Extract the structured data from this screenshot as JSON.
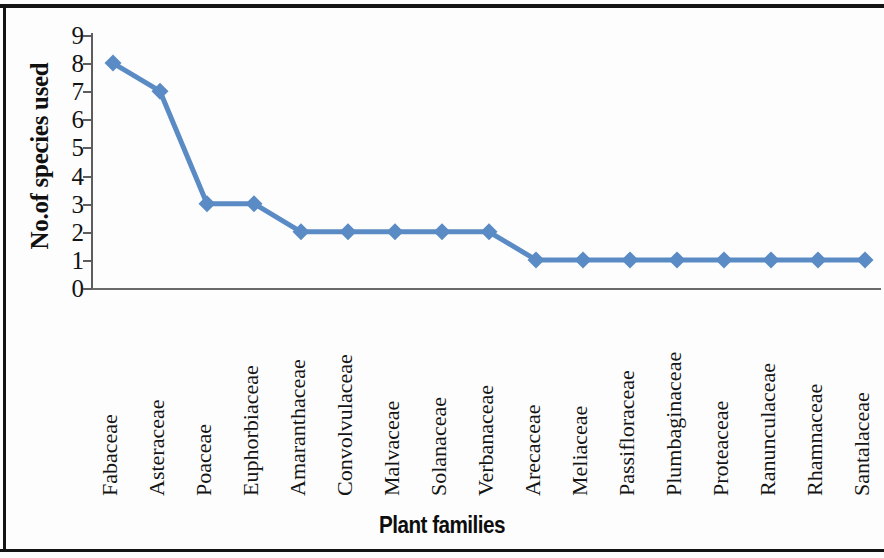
{
  "chart_data": {
    "type": "line",
    "title": "",
    "xlabel": "Plant families",
    "ylabel": "No.of species used",
    "categories": [
      "Fabaceae",
      "Asteraceae",
      "Poaceae",
      "Euphorbiaceae",
      "Amaranthaceae",
      "Convolvulaceae",
      "Malvaceae",
      "Solanaceae",
      "Verbanaceae",
      "Arecaceae",
      "Meliaceae",
      "Passifloraceae",
      "Plumbaginaceae",
      "Proteaceae",
      "Ranunculaceae",
      "Rhamnaceae",
      "Santalaceae"
    ],
    "values": [
      8,
      7,
      3,
      3,
      2,
      2,
      2,
      2,
      2,
      1,
      1,
      1,
      1,
      1,
      1,
      1,
      1
    ],
    "ylim": [
      0,
      9
    ],
    "y_ticks": [
      9,
      8,
      7,
      6,
      5,
      4,
      3,
      2,
      1,
      0
    ],
    "grid": false,
    "legend": "none",
    "series_color": "#5b8bc4",
    "marker": "diamond",
    "marker_color": "#5b8bc4",
    "line_color": "#5b8bc4",
    "axis_color": "#5d5d5d",
    "text_color": "#131313"
  }
}
